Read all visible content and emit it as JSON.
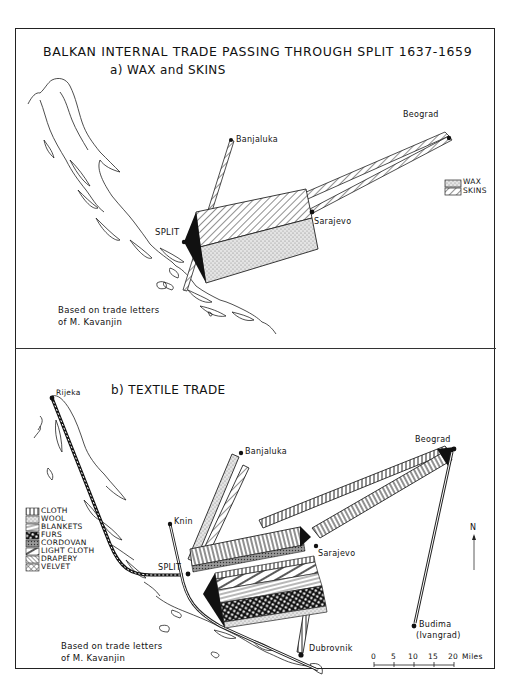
{
  "map": {
    "title": "BALKAN INTERNAL TRADE PASSING THROUGH SPLIT 1637-1659",
    "panel_a": {
      "subtitle": "a) WAX and SKINS",
      "places": {
        "banjaluka": "Banjaluka",
        "beograd": "Beograd",
        "split": "SPLIT",
        "sarajevo": "Sarajevo"
      },
      "legend": [
        {
          "label": "WAX",
          "pattern": "stipple"
        },
        {
          "label": "SKINS",
          "pattern": "diagonal-hatch"
        }
      ],
      "note_line1": "Based on trade letters",
      "note_line2": "of M. Kavanjin"
    },
    "panel_b": {
      "subtitle": "b) TEXTILE TRADE",
      "places": {
        "rijeka": "Rijeka",
        "banjaluka": "Banjaluka",
        "beograd": "Beograd",
        "knin": "Knin",
        "split": "SPLIT",
        "sarajevo": "Sarajevo",
        "dubrovnik": "Dubrovnik",
        "budima": "Budima",
        "budima_alt": "(Ivangrad)"
      },
      "legend": [
        {
          "label": "CLOTH",
          "pattern": "vertical-bars"
        },
        {
          "label": "WOOL",
          "pattern": "stipple"
        },
        {
          "label": "BLANKETS",
          "pattern": "horizontal-lines"
        },
        {
          "label": "FURS",
          "pattern": "checker"
        },
        {
          "label": "CORDOVAN",
          "pattern": "dense-dots"
        },
        {
          "label": "LIGHT CLOTH",
          "pattern": "wide-diagonal"
        },
        {
          "label": "DRAPERY",
          "pattern": "fine-diagonal"
        },
        {
          "label": "VELVET",
          "pattern": "crosshatch"
        }
      ],
      "north_label": "N",
      "scale": {
        "ticks": [
          "0",
          "5",
          "10",
          "15",
          "20"
        ],
        "unit": "Miles"
      },
      "note_line1": "Based on trade letters",
      "note_line2": "of M. Kavanjin"
    }
  }
}
